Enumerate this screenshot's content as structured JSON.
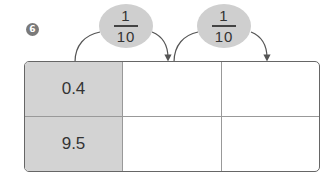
{
  "question": {
    "number": "6"
  },
  "operations": [
    {
      "numerator": "1",
      "denominator": "10"
    },
    {
      "numerator": "1",
      "denominator": "10"
    }
  ],
  "table": {
    "rows": [
      [
        "0.4",
        "",
        ""
      ],
      [
        "9.5",
        "",
        ""
      ]
    ]
  },
  "colors": {
    "badge": "#7a7a7a",
    "oval": "#cfcfcf",
    "given_cell": "#d3d3d3",
    "border": "#666666"
  }
}
